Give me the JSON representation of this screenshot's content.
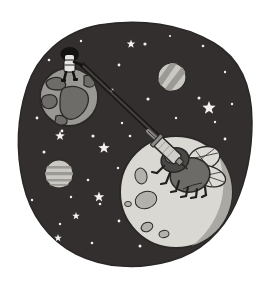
{
  "illustration": {
    "title": "Space scene: astronaut on Earth tethered to a syringe capturing a fly on the Moon",
    "caption": "Cartoon illustration of deep space with an astronaut standing on Earth holding a long double-stranded tether that runs across the starfield to a syringe injecting a winged fly resting on the Moon.",
    "canvas": {
      "width": 271,
      "height": 285
    },
    "colors": {
      "page_background": "#ffffff",
      "space_blob": "#332f2f",
      "space_blob_outline": "#2a2727",
      "star_light": "#f2f1ee",
      "star_dim": "#cfcdc9",
      "earth_ocean": "#9a9894",
      "earth_land": "#6e6c69",
      "earth_outline": "#2b2927",
      "moon_body": "#d9d8d3",
      "moon_shadow": "#a9a8a3",
      "moon_crater": "#b2b1ac",
      "moon_outline": "#2b2927",
      "planet_body": "#c9c8c3",
      "planet_band": "#9b9a95",
      "fly_body": "#6d6b68",
      "fly_body_dark": "#4a4846",
      "fly_wing": "#dddbd6",
      "fly_leg": "#211f1e",
      "syringe_barrel": "#cfcec9",
      "syringe_metal": "#8e8c88",
      "tether": "#1a1918",
      "astronaut_suit": "#e8e6e2",
      "astronaut_dark": "#141312"
    }
  },
  "objects": {
    "space_background": {
      "name": "space-blob",
      "label": "Outer space background"
    },
    "earth": {
      "name": "earth",
      "label": "Earth",
      "center": {
        "x": 69,
        "y": 97
      },
      "radius": 29
    },
    "moon": {
      "name": "moon",
      "label": "Moon",
      "center": {
        "x": 176,
        "y": 192
      },
      "radius": 56,
      "craters": 5
    },
    "astronaut": {
      "name": "astronaut",
      "label": "Astronaut on Earth",
      "position": {
        "x": 68,
        "y": 62
      }
    },
    "tether": {
      "name": "tether-line",
      "label": "Double tether line from astronaut to syringe",
      "from": {
        "x": 80,
        "y": 66
      },
      "to": {
        "x": 167,
        "y": 151
      },
      "strands": 2
    },
    "syringe": {
      "name": "syringe",
      "label": "Syringe injecting the fly",
      "position": {
        "x": 170,
        "y": 155
      }
    },
    "fly": {
      "name": "fly",
      "label": "Winged fly on the Moon",
      "position": {
        "x": 186,
        "y": 168
      },
      "wings": 2,
      "legs": 6
    },
    "planet_upper_right": {
      "name": "planet-striped-upper-right",
      "label": "Striped planet (upper right)",
      "center": {
        "x": 172,
        "y": 77
      },
      "radius": 14
    },
    "planet_left": {
      "name": "planet-striped-left",
      "label": "Striped planet (left)",
      "center": {
        "x": 59,
        "y": 174
      },
      "radius": 14
    }
  },
  "stars": {
    "label": "Starfield",
    "dots": [
      {
        "x": 81,
        "y": 41,
        "r": 1.2
      },
      {
        "x": 145,
        "y": 44,
        "r": 1.6
      },
      {
        "x": 170,
        "y": 36,
        "r": 1.1
      },
      {
        "x": 203,
        "y": 46,
        "r": 1.3
      },
      {
        "x": 119,
        "y": 65,
        "r": 1.4
      },
      {
        "x": 49,
        "y": 60,
        "r": 1.3
      },
      {
        "x": 225,
        "y": 72,
        "r": 1.2
      },
      {
        "x": 112,
        "y": 90,
        "r": 1.5
      },
      {
        "x": 148,
        "y": 99,
        "r": 1.6
      },
      {
        "x": 199,
        "y": 98,
        "r": 1.5
      },
      {
        "x": 232,
        "y": 104,
        "r": 1.2
      },
      {
        "x": 122,
        "y": 123,
        "r": 1.2
      },
      {
        "x": 93,
        "y": 136,
        "r": 1.6
      },
      {
        "x": 44,
        "y": 152,
        "r": 1.5
      },
      {
        "x": 62,
        "y": 131,
        "r": 1.4
      },
      {
        "x": 130,
        "y": 136,
        "r": 1.3
      },
      {
        "x": 225,
        "y": 139,
        "r": 1.4
      },
      {
        "x": 88,
        "y": 180,
        "r": 1.3
      },
      {
        "x": 118,
        "y": 168,
        "r": 1.2
      },
      {
        "x": 100,
        "y": 204,
        "r": 1.3
      },
      {
        "x": 71,
        "y": 197,
        "r": 1.2
      },
      {
        "x": 119,
        "y": 221,
        "r": 1.4
      },
      {
        "x": 92,
        "y": 243,
        "r": 1.3
      },
      {
        "x": 60,
        "y": 224,
        "r": 1.2
      },
      {
        "x": 140,
        "y": 246,
        "r": 1.5
      },
      {
        "x": 32,
        "y": 200,
        "r": 1.2
      },
      {
        "x": 37,
        "y": 118,
        "r": 1.4
      },
      {
        "x": 215,
        "y": 122,
        "r": 1.2
      },
      {
        "x": 176,
        "y": 118,
        "r": 1.2
      }
    ],
    "sparkles": [
      {
        "x": 209,
        "y": 108,
        "r": 7
      },
      {
        "x": 104,
        "y": 148,
        "r": 6
      },
      {
        "x": 60,
        "y": 136,
        "r": 5
      },
      {
        "x": 99,
        "y": 197,
        "r": 5.5
      },
      {
        "x": 131,
        "y": 44,
        "r": 4.5
      },
      {
        "x": 58,
        "y": 238,
        "r": 4
      },
      {
        "x": 76,
        "y": 216,
        "r": 4
      }
    ]
  }
}
